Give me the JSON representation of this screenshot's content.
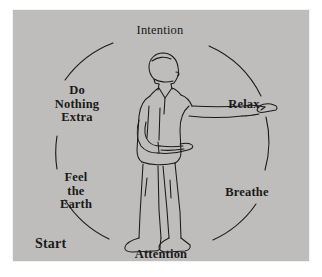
{
  "panel": {
    "background_color": "#bebdbb",
    "border_color": "#f2f2f2",
    "ink_color": "#1a1a1a"
  },
  "diagram": {
    "type": "cycle",
    "title_visible": false,
    "center_figure": "standing-man-profile-arm-extended-pointing-right",
    "circle": {
      "center_x": 149,
      "center_y": 128,
      "radius": 105,
      "stroke_color": "#1a1a1a",
      "interrupted_by_labels": true
    },
    "start_label": "Start",
    "labels": [
      {
        "id": "intention",
        "text": "Intention",
        "position": "top",
        "bold": false
      },
      {
        "id": "relax",
        "text": "Relax",
        "position": "upper-right",
        "bold": true
      },
      {
        "id": "breathe",
        "text": "Breathe",
        "position": "lower-right",
        "bold": true
      },
      {
        "id": "attention",
        "text": "Attention",
        "position": "bottom",
        "bold": true
      },
      {
        "id": "feel-the-earth",
        "lines": [
          "Feel",
          "the",
          "Earth"
        ],
        "position": "lower-left",
        "bold": true
      },
      {
        "id": "do-nothing-extra",
        "lines": [
          "Do",
          "Nothing",
          "Extra"
        ],
        "position": "upper-left",
        "bold": true
      }
    ]
  },
  "feel_the_earth": {
    "line1": "Feel",
    "line2": "the",
    "line3": "Earth"
  },
  "do_nothing_extra": {
    "line1": "Do",
    "line2": "Nothing",
    "line3": "Extra"
  }
}
